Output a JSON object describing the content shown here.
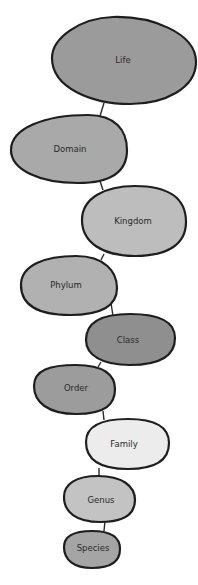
{
  "diagram": {
    "nodes": [
      {
        "label": "Life",
        "color": "#9b9b9b"
      },
      {
        "label": "Domain",
        "color": "#a9a9a9"
      },
      {
        "label": "Kingdom",
        "color": "#bdbdbd"
      },
      {
        "label": "Phylum",
        "color": "#b1b1b1"
      },
      {
        "label": "Class",
        "color": "#8f8f8f"
      },
      {
        "label": "Order",
        "color": "#9c9c9c"
      },
      {
        "label": "Family",
        "color": "#ececec"
      },
      {
        "label": "Genus",
        "color": "#c3c3c3"
      },
      {
        "label": "Species",
        "color": "#a5a5a5"
      }
    ]
  }
}
